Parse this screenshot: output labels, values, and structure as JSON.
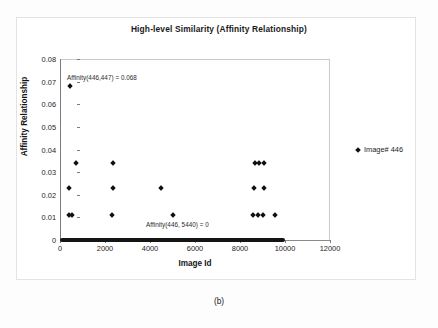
{
  "caption": "(b)",
  "legend": {
    "label": "Image# 446",
    "marker": "diamond-marker",
    "position": "right"
  },
  "chart_data": {
    "type": "scatter",
    "title": "High-level Similarity (Affinity Relationship)",
    "xlabel": "Image Id",
    "ylabel": "Affinity Relationship",
    "xlim": [
      0,
      12000
    ],
    "ylim": [
      0,
      0.08
    ],
    "xticks": [
      0,
      2000,
      4000,
      6000,
      8000,
      10000,
      12000
    ],
    "xtick_labels": [
      "0",
      "2000",
      "4000",
      "6000",
      "8000",
      "10000",
      "12000"
    ],
    "yticks": [
      0,
      0.01,
      0.02,
      0.03,
      0.04,
      0.05,
      0.06,
      0.07,
      0.08
    ],
    "ytick_labels": [
      "0",
      "0.01",
      "0.02",
      "0.03",
      "0.04",
      "0.05",
      "0.06",
      "0.07",
      "0.08"
    ],
    "grid": false,
    "marker": "diamond",
    "marker_color": "#111111",
    "series": [
      {
        "name": "Image# 446",
        "points": [
          [
            447,
            0.068
          ],
          [
            700,
            0.034
          ],
          [
            2350,
            0.034
          ],
          [
            8650,
            0.034
          ],
          [
            8850,
            0.034
          ],
          [
            9080,
            0.034
          ],
          [
            420,
            0.023
          ],
          [
            2350,
            0.023
          ],
          [
            4480,
            0.023
          ],
          [
            8620,
            0.023
          ],
          [
            9080,
            0.023
          ],
          [
            400,
            0.011
          ],
          [
            530,
            0.011
          ],
          [
            2330,
            0.011
          ],
          [
            5000,
            0.011
          ],
          [
            8560,
            0.011
          ],
          [
            8780,
            0.011
          ],
          [
            9010,
            0.011
          ],
          [
            9550,
            0.011
          ]
        ]
      }
    ],
    "zero_band": {
      "y": 0,
      "x_start": 0,
      "x_end": 10000,
      "note": "dense band of near-zero affinity values"
    },
    "annotations": [
      {
        "text": "Affinity(446,447) = 0.068",
        "x": 447,
        "y": 0.0735
      },
      {
        "text": "Affinity(446, 5440) = 0",
        "x": 5440,
        "y": 0.0065
      }
    ]
  }
}
